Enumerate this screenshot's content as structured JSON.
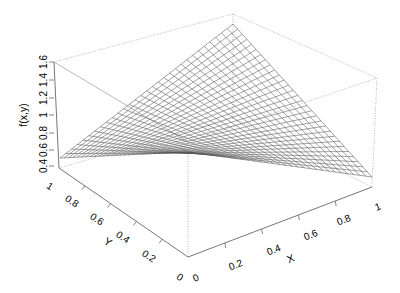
{
  "chart_data": {
    "type": "surface3d",
    "title": "",
    "function_label": "f(x,y)",
    "xlabel": "X",
    "ylabel": "Y",
    "zlabel": "f(x,y)",
    "xlim": [
      0,
      1
    ],
    "ylim": [
      0,
      1
    ],
    "zlim": [
      0.4,
      1.6
    ],
    "grid_resolution": 30,
    "x_ticks": [
      "0",
      "0.2",
      "0.4",
      "0.6",
      "0.8",
      "1"
    ],
    "y_ticks": [
      "0",
      "0.2",
      "0.4",
      "0.6",
      "0.8",
      "1"
    ],
    "z_ticks": [
      "0.4",
      "0.6",
      "0.8",
      "1",
      "1.2",
      "1.4",
      "1.6"
    ],
    "corner_values": [
      {
        "x": 0,
        "y": 0,
        "z": 0.5
      },
      {
        "x": 1,
        "y": 0,
        "z": 0.5
      },
      {
        "x": 0,
        "y": 1,
        "z": 0.5
      },
      {
        "x": 1,
        "y": 1,
        "z": 1.5
      }
    ],
    "surface_style": "wireframe",
    "box": true,
    "colors": {
      "mesh": "#555555",
      "box": "#999999",
      "axis": "#666666",
      "text": "#000000"
    }
  },
  "labels": {
    "z_axis": "f(x,y)",
    "x_axis": "X",
    "y_axis": "Y",
    "x_ticks": [
      "0",
      "0.2",
      "0.4",
      "0.6",
      "0.8",
      "1"
    ],
    "y_ticks": [
      "0",
      "0.2",
      "0.4",
      "0.6",
      "0.8",
      "1"
    ],
    "z_ticks": [
      "0.4",
      "0.6",
      "0.8",
      "1",
      "1.2",
      "1.4",
      "1.6"
    ]
  }
}
